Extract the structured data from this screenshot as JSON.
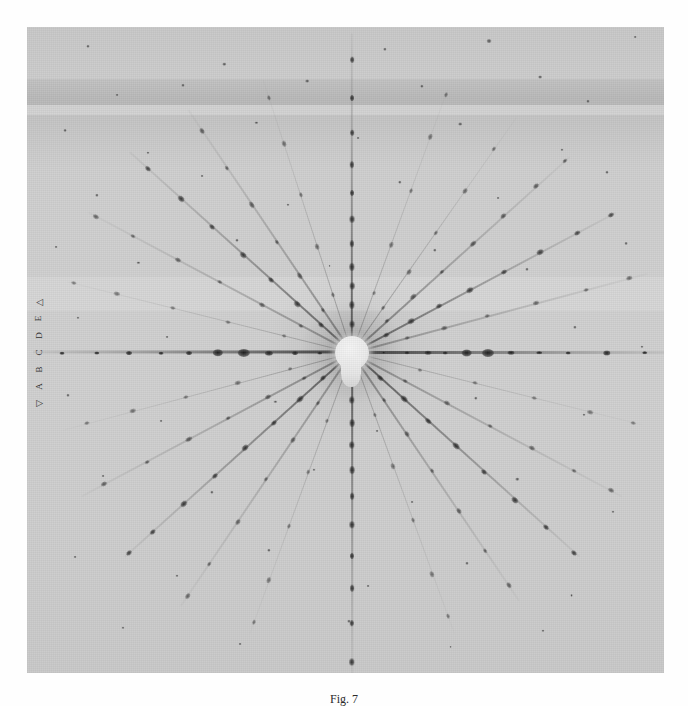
{
  "figure": {
    "caption": "Fig. 7",
    "kind": "laue-x-ray-diffraction-photograph"
  },
  "plate": {
    "background_color": "#cdcdcd",
    "border_color": "#bcbcbc",
    "x": 27,
    "y": 27,
    "width": 637,
    "height": 646
  },
  "beamstop": {
    "label": "beam-stop-shadow",
    "center_x_pct": 51.0,
    "center_y_pct": 50.4,
    "radius_px": 17,
    "stem_height_px": 30,
    "color": "#efefef"
  },
  "edge_scale": {
    "top_marker": "△",
    "bottom_marker": "▽",
    "glyphs": [
      "△",
      "E",
      "D",
      "C",
      "B",
      "A",
      "▽"
    ]
  },
  "chart_data": {
    "type": "scatter",
    "title": "Fig. 7",
    "xlabel": "",
    "ylabel": "",
    "xlim": [
      0,
      100
    ],
    "ylim": [
      0,
      100
    ],
    "grid": false,
    "legend": "none",
    "center": [
      51.0,
      50.4
    ],
    "series": [
      {
        "name": "streak-000",
        "angle": 0,
        "len": 50,
        "weight": 2.6,
        "darkness": 0.92,
        "r": [
          5.0,
          8.6,
          12.0,
          14.6,
          18.0,
          21.4,
          25.0,
          29.4,
          34.0,
          40.0,
          46.0
        ],
        "size": [
          1.6,
          2.2,
          3.0,
          2.0,
          4.6,
          5.2,
          3.0,
          2.4,
          2.0,
          3.2,
          2.4
        ]
      },
      {
        "name": "streak-015",
        "angle": 15,
        "len": 48,
        "weight": 1.5,
        "darkness": 0.42,
        "r": [
          9.0,
          15.0,
          22.0,
          30.0,
          38.0,
          45.0
        ],
        "size": [
          2.0,
          2.4,
          2.0,
          2.6,
          2.0,
          2.4
        ]
      },
      {
        "name": "streak-028",
        "angle": 28,
        "len": 47,
        "weight": 2.1,
        "darkness": 0.7,
        "r": [
          6.0,
          10.5,
          15.5,
          21.0,
          27.0,
          33.5,
          40.0,
          46.0
        ],
        "size": [
          2.4,
          3.0,
          2.6,
          3.2,
          2.6,
          3.0,
          2.4,
          2.6
        ]
      },
      {
        "name": "streak-042",
        "angle": 42,
        "len": 46,
        "weight": 1.8,
        "darkness": 0.55,
        "r": [
          7.5,
          13.0,
          19.0,
          25.5,
          32.0,
          39.0,
          45.0
        ],
        "size": [
          2.2,
          2.8,
          2.2,
          2.8,
          2.4,
          2.6,
          2.2
        ]
      },
      {
        "name": "streak-055",
        "angle": 55,
        "len": 45,
        "weight": 1.4,
        "darkness": 0.4,
        "r": [
          8.5,
          15.5,
          23.0,
          31.0,
          39.0
        ],
        "size": [
          2.0,
          2.6,
          2.2,
          2.6,
          2.2
        ]
      },
      {
        "name": "streak-070",
        "angle": 70,
        "len": 44,
        "weight": 1.3,
        "darkness": 0.34,
        "r": [
          10.0,
          18.0,
          27.0,
          36.0,
          43.0
        ],
        "size": [
          1.8,
          2.4,
          2.0,
          2.4,
          2.0
        ]
      },
      {
        "name": "streak-090",
        "angle": 90,
        "len": 50,
        "weight": 2.4,
        "darkness": 0.78,
        "r": [
          4.5,
          7.5,
          10.5,
          13.5,
          17.0,
          21.0,
          25.0,
          29.5,
          34.5,
          40.0,
          46.0
        ],
        "size": [
          3.2,
          3.4,
          3.0,
          3.4,
          2.8,
          3.2,
          2.6,
          2.8,
          2.4,
          2.6,
          2.4
        ]
      },
      {
        "name": "streak-108",
        "angle": 108,
        "len": 45,
        "weight": 1.4,
        "darkness": 0.38,
        "r": [
          9.5,
          17.5,
          26.0,
          34.5,
          42.0
        ],
        "size": [
          2.0,
          2.4,
          2.0,
          2.4,
          2.0
        ]
      },
      {
        "name": "streak-124",
        "angle": 124,
        "len": 46,
        "weight": 1.7,
        "darkness": 0.5,
        "r": [
          8.0,
          14.5,
          21.0,
          28.0,
          35.0,
          42.0
        ],
        "size": [
          2.2,
          2.8,
          2.2,
          2.8,
          2.2,
          2.6
        ]
      },
      {
        "name": "streak-138",
        "angle": 138,
        "len": 47,
        "weight": 2.2,
        "darkness": 0.72,
        "r": [
          6.5,
          11.5,
          17.0,
          23.0,
          29.5,
          36.0,
          43.0
        ],
        "size": [
          2.6,
          3.2,
          2.6,
          3.2,
          2.6,
          3.0,
          2.4
        ]
      },
      {
        "name": "streak-152",
        "angle": 152,
        "len": 47,
        "weight": 1.5,
        "darkness": 0.44,
        "r": [
          9.0,
          16.0,
          23.5,
          31.0,
          39.0,
          45.5
        ],
        "size": [
          2.0,
          2.6,
          2.0,
          2.6,
          2.2,
          2.4
        ]
      },
      {
        "name": "streak-166",
        "angle": 166,
        "len": 46,
        "weight": 1.3,
        "darkness": 0.32,
        "r": [
          11.0,
          20.0,
          29.0,
          38.0,
          45.0
        ],
        "size": [
          1.8,
          2.2,
          2.0,
          2.4,
          2.0
        ]
      },
      {
        "name": "streak-180",
        "angle": 180,
        "len": 50,
        "weight": 2.6,
        "darkness": 0.92,
        "r": [
          5.0,
          9.0,
          13.0,
          17.0,
          21.0,
          25.5,
          30.0,
          35.0,
          40.0,
          45.5
        ],
        "size": [
          2.0,
          2.6,
          3.4,
          5.0,
          4.2,
          2.6,
          2.2,
          2.6,
          2.0,
          2.2
        ]
      },
      {
        "name": "streak-195",
        "angle": 195,
        "len": 47,
        "weight": 1.4,
        "darkness": 0.36,
        "r": [
          10.0,
          18.5,
          27.0,
          35.5,
          43.0
        ],
        "size": [
          1.8,
          2.4,
          2.0,
          2.4,
          2.0
        ]
      },
      {
        "name": "streak-208",
        "angle": 208,
        "len": 48,
        "weight": 1.7,
        "darkness": 0.5,
        "r": [
          8.5,
          15.0,
          22.0,
          29.0,
          36.5,
          44.0
        ],
        "size": [
          2.2,
          2.6,
          2.2,
          2.8,
          2.2,
          2.6
        ]
      },
      {
        "name": "streak-222",
        "angle": 222,
        "len": 48,
        "weight": 2.3,
        "darkness": 0.76,
        "r": [
          6.0,
          11.0,
          16.5,
          22.5,
          29.0,
          35.5,
          42.0,
          47.0
        ],
        "size": [
          2.6,
          3.4,
          2.6,
          3.2,
          2.6,
          3.0,
          2.4,
          2.6
        ]
      },
      {
        "name": "streak-236",
        "angle": 236,
        "len": 48,
        "weight": 1.5,
        "darkness": 0.44,
        "r": [
          9.5,
          16.5,
          24.0,
          32.0,
          40.0,
          46.0
        ],
        "size": [
          2.0,
          2.6,
          2.0,
          2.6,
          2.2,
          2.4
        ]
      },
      {
        "name": "streak-250",
        "angle": 250,
        "len": 47,
        "weight": 1.3,
        "darkness": 0.34,
        "r": [
          11.5,
          20.0,
          29.0,
          38.0,
          45.0
        ],
        "size": [
          1.8,
          2.2,
          2.0,
          2.4,
          2.0
        ]
      },
      {
        "name": "streak-270",
        "angle": 270,
        "len": 51,
        "weight": 2.4,
        "darkness": 0.8,
        "r": [
          7.5,
          11.0,
          14.5,
          18.5,
          22.5,
          27.0,
          32.0,
          37.0,
          42.5,
          48.5
        ],
        "size": [
          3.0,
          3.4,
          3.0,
          3.4,
          2.8,
          3.2,
          2.6,
          2.8,
          2.4,
          3.0
        ]
      },
      {
        "name": "streak-290",
        "angle": 290,
        "len": 47,
        "weight": 1.3,
        "darkness": 0.34,
        "r": [
          10.5,
          19.0,
          28.0,
          37.0,
          44.0
        ],
        "size": [
          1.8,
          2.4,
          2.0,
          2.4,
          2.0
        ]
      },
      {
        "name": "streak-304",
        "angle": 304,
        "len": 47,
        "weight": 1.6,
        "darkness": 0.48,
        "r": [
          9.0,
          15.5,
          22.5,
          30.0,
          37.5,
          44.0
        ],
        "size": [
          2.0,
          2.6,
          2.2,
          2.6,
          2.2,
          2.4
        ]
      },
      {
        "name": "streak-318",
        "angle": 318,
        "len": 48,
        "weight": 2.3,
        "darkness": 0.78,
        "r": [
          6.0,
          11.0,
          16.0,
          22.0,
          28.0,
          34.5,
          41.0,
          47.0
        ],
        "size": [
          2.8,
          3.4,
          2.8,
          3.4,
          2.6,
          3.0,
          2.4,
          2.6
        ]
      },
      {
        "name": "streak-332",
        "angle": 332,
        "len": 48,
        "weight": 1.5,
        "darkness": 0.44,
        "r": [
          9.5,
          17.0,
          24.5,
          32.0,
          39.5,
          46.0
        ],
        "size": [
          2.0,
          2.6,
          2.0,
          2.6,
          2.2,
          2.4
        ]
      },
      {
        "name": "streak-346",
        "angle": 346,
        "len": 47,
        "weight": 1.3,
        "darkness": 0.32,
        "r": [
          11.0,
          20.0,
          29.5,
          38.5,
          45.5
        ],
        "size": [
          1.8,
          2.2,
          2.0,
          2.4,
          2.0
        ]
      }
    ],
    "stray_spots": [
      [
        9.5,
        3.0,
        1.6
      ],
      [
        31.0,
        5.8,
        1.8
      ],
      [
        56.2,
        3.4,
        1.7
      ],
      [
        72.5,
        2.2,
        2.6
      ],
      [
        95.5,
        1.5,
        1.4
      ],
      [
        14.2,
        10.5,
        1.5
      ],
      [
        24.5,
        9.0,
        1.6
      ],
      [
        44.0,
        8.4,
        1.9
      ],
      [
        62.0,
        9.2,
        1.7
      ],
      [
        80.5,
        7.8,
        2.0
      ],
      [
        88.0,
        11.5,
        1.6
      ],
      [
        6.0,
        16.0,
        1.5
      ],
      [
        19.0,
        19.5,
        1.6
      ],
      [
        36.0,
        14.8,
        1.7
      ],
      [
        52.0,
        17.2,
        1.5
      ],
      [
        68.0,
        15.0,
        1.9
      ],
      [
        84.0,
        19.0,
        1.6
      ],
      [
        11.0,
        26.0,
        1.7
      ],
      [
        27.5,
        23.0,
        1.5
      ],
      [
        41.0,
        27.5,
        1.6
      ],
      [
        58.5,
        24.0,
        1.8
      ],
      [
        74.0,
        26.5,
        1.5
      ],
      [
        91.0,
        22.5,
        1.6
      ],
      [
        4.5,
        34.0,
        1.5
      ],
      [
        17.5,
        36.5,
        1.7
      ],
      [
        33.0,
        33.0,
        1.6
      ],
      [
        47.5,
        37.0,
        1.5
      ],
      [
        64.0,
        34.5,
        1.8
      ],
      [
        78.5,
        37.5,
        1.6
      ],
      [
        94.0,
        33.5,
        1.5
      ],
      [
        8.0,
        45.0,
        1.6
      ],
      [
        22.0,
        48.0,
        1.5
      ],
      [
        86.0,
        46.5,
        1.7
      ],
      [
        96.5,
        49.5,
        1.6
      ],
      [
        6.5,
        57.0,
        1.6
      ],
      [
        21.0,
        61.0,
        1.5
      ],
      [
        39.0,
        58.0,
        1.7
      ],
      [
        55.0,
        62.5,
        1.5
      ],
      [
        70.5,
        57.5,
        1.8
      ],
      [
        87.5,
        60.0,
        1.6
      ],
      [
        12.0,
        69.5,
        1.5
      ],
      [
        29.0,
        72.0,
        1.7
      ],
      [
        45.0,
        68.5,
        1.6
      ],
      [
        60.5,
        73.5,
        1.5
      ],
      [
        77.0,
        70.0,
        1.8
      ],
      [
        92.0,
        75.0,
        1.6
      ],
      [
        7.5,
        82.0,
        1.5
      ],
      [
        23.5,
        85.0,
        1.6
      ],
      [
        38.0,
        81.0,
        1.7
      ],
      [
        53.5,
        86.5,
        1.5
      ],
      [
        69.0,
        83.0,
        1.6
      ],
      [
        85.5,
        88.0,
        1.5
      ],
      [
        15.0,
        93.0,
        1.6
      ],
      [
        33.5,
        95.5,
        1.5
      ],
      [
        50.5,
        92.0,
        1.7
      ],
      [
        66.5,
        96.0,
        1.5
      ],
      [
        81.0,
        93.5,
        1.6
      ]
    ]
  }
}
